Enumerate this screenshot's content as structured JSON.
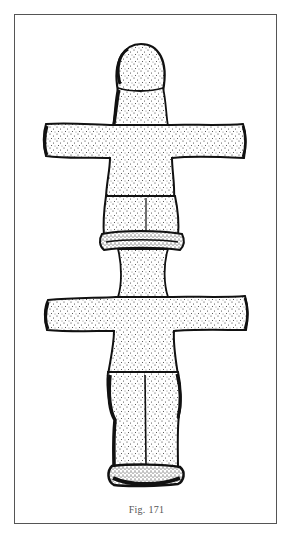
{
  "page": {
    "caption": "Fig. 171",
    "figure_description": "Stippled drawing of a double (stacked) cruciform figurine with round head"
  },
  "colors": {
    "ink": "#111111",
    "frame": "#555555",
    "paper": "#ffffff",
    "caption": "#555555"
  }
}
